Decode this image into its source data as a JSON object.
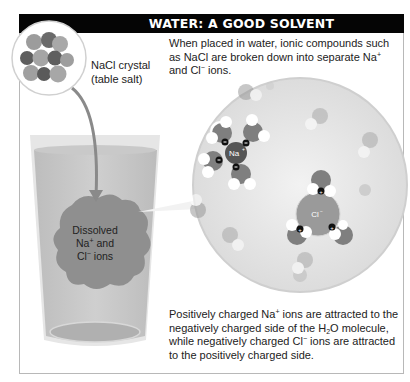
{
  "header": {
    "title": "WATER: A GOOD SOLVENT"
  },
  "crystal": {
    "label_line1": "NaCl crystal",
    "label_line2": "(table salt)"
  },
  "intro": {
    "line1": "When placed in water, ionic compounds such",
    "line2_pre": "as NaCl are broken down into separate Na",
    "line2_sup": "+",
    "line3_pre": "and Cl",
    "line3_sup": "−",
    "line3_post": " ions."
  },
  "beaker": {
    "line1": "Dissolved",
    "line2_pre": "Na",
    "line2_sup": "+",
    "line2_post": " and",
    "line3_pre": "Cl",
    "line3_sup": "−",
    "line3_post": " ions"
  },
  "magnified": {
    "na_label": "Na",
    "na_sup": "+",
    "cl_label": "Cl",
    "cl_sup": "−",
    "neg_sign": "−",
    "pos_sign": "+"
  },
  "explanation": {
    "line1_pre": "Positively charged Na",
    "line1_sup": "+",
    "line1_post": " ions are attracted to the",
    "line2_pre": "negatively charged side of the H",
    "line2_sub": "2",
    "line2_post": "O molecule,",
    "line3_pre": "while negatively charged Cl",
    "line3_sup": "−",
    "line3_post": " ions are attracted",
    "line4": "to the positively charged side."
  },
  "colors": {
    "header_bg": "#050505",
    "header_text": "#ffffff",
    "circle_bg": "#e6e6e6",
    "beaker_liquid": "#c4c4c4",
    "ion_cloud": "#8f8f8f",
    "oxygen": "#8a8a8a",
    "hydrogen": "#ffffff",
    "na_ion": "#5a5a5a",
    "cl_ion": "#9a9a9a"
  }
}
